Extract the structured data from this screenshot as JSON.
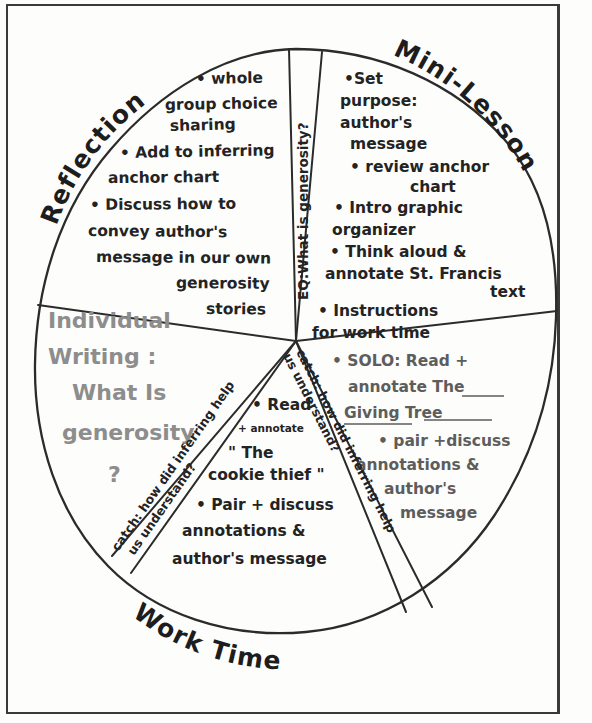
{
  "diagram": {
    "type": "hand-drawn pie wheel lesson plan",
    "title_visible": false,
    "center": {
      "x": 296,
      "y": 341
    },
    "radius": 292
  },
  "sectors": [
    {
      "id": "reflection",
      "label": "Reflection",
      "label_position": "outside-upper-left-arc",
      "ink": "dark",
      "bullets": [
        "whole group choice sharing",
        "Add to inferring anchor chart",
        "Discuss how to convey author's message in our own generosity stories"
      ],
      "lines": [
        "• whole",
        "group choice",
        "sharing",
        "• Add to inferring",
        "anchor  chart",
        "• Discuss how to",
        "convey  author's",
        "message  in our own",
        "generosity",
        "stories"
      ]
    },
    {
      "id": "eq-wedge",
      "label": "EQ: What is generosity?",
      "label_position": "vertical-thin-wedge-top-center",
      "ink": "dark",
      "lines": [
        "EQ:What is generosity?"
      ]
    },
    {
      "id": "mini-lesson",
      "label": "Mini-Lesson",
      "label_position": "outside-upper-right-arc",
      "ink": "dark",
      "bullets": [
        "Set purpose: author's message",
        "review anchor chart",
        "Intro graphic organizer",
        "Think aloud & annotate St. Francis text",
        "Instructions for work time"
      ],
      "lines": [
        "•Set",
        "purpose:",
        "author's",
        "message",
        "• review anchor",
        "chart",
        "• Intro graphic",
        "organizer",
        "• Think  aloud  &",
        "annotate  St. Francis",
        "text",
        "• Instructions",
        "for  work  time"
      ]
    },
    {
      "id": "work-time-right",
      "label": "",
      "label_position": "lower-right",
      "ink": "mid",
      "bullets": [
        "SOLO: Read + annotate The Giving Tree",
        "pair + discuss annotations & author's message"
      ],
      "lines": [
        "• SOLO: Read +",
        "annotate The",
        "Giving  Tree",
        "• pair +discuss",
        "annotations   &",
        "author's",
        "message"
      ]
    },
    {
      "id": "work-time-middle",
      "label": "",
      "label_position": "bottom-center",
      "ink": "dark",
      "bullets": [
        "Read + annotate \"The cookie thief\"",
        "Pair + discuss annotations & author's message"
      ],
      "lines": [
        "• Read",
        "+ annotate",
        "\" The",
        "cookie thief \"",
        "• Pair + discuss",
        "annotations     &",
        "author's  message"
      ]
    },
    {
      "id": "individual-writing",
      "label": "Individual Writing: What is generosity ?",
      "label_position": "left",
      "ink": "light",
      "lines": [
        "Individual",
        "Writing :",
        "What  Is",
        "generosity",
        "?"
      ]
    }
  ],
  "divider_labels": [
    {
      "id": "catch-left",
      "text_line1": "catch: how did inferring help",
      "text_line2": "us understand?",
      "orientation": "diagonal-lower-left"
    },
    {
      "id": "catch-right",
      "text_line1": "catch: how did inferring help",
      "text_line2": "us understand?",
      "orientation": "diagonal-lower-right"
    }
  ],
  "arc_labels": [
    {
      "id": "reflection-arc",
      "text": "Reflection"
    },
    {
      "id": "mini-lesson-arc",
      "text": "Mini-Lesson"
    },
    {
      "id": "work-time-arc",
      "text": "Work  Time"
    }
  ],
  "colors": {
    "ink_dark": "#232323",
    "ink_mid": "#5d5d5d",
    "ink_light": "#8d8d8d",
    "paper": "#fdfdfc",
    "outline": "#2b2b2b"
  }
}
